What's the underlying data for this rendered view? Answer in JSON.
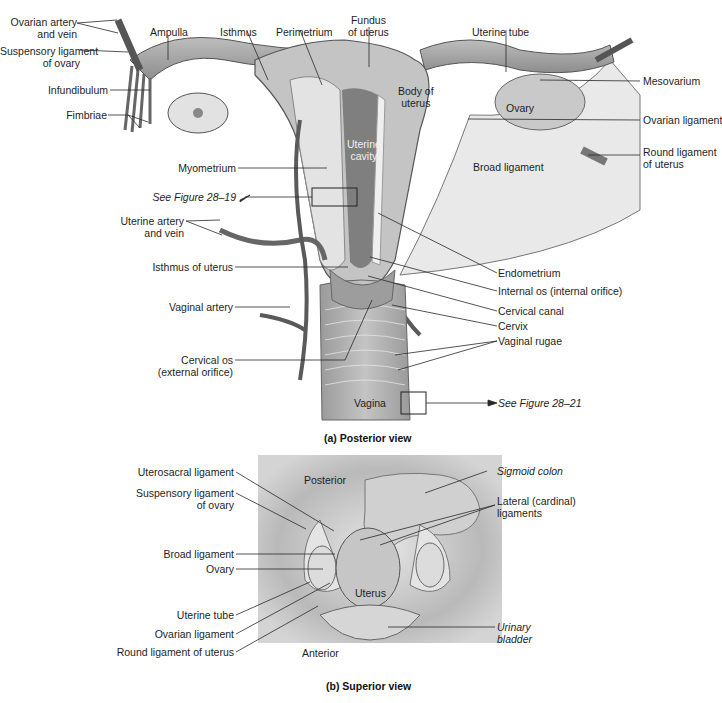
{
  "figure_a": {
    "caption": "(a) Posterior view",
    "labels": {
      "ovarian_artery_vein": [
        "Ovarian artery",
        "and vein"
      ],
      "suspensory_ligament": [
        "Suspensory ligament",
        "of ovary"
      ],
      "infundibulum": "Infundibulum",
      "fimbriae": "Fimbriae",
      "ampulla": "Ampulla",
      "isthmus": "Isthmus",
      "perimetrium": "Perimetrium",
      "fundus": [
        "Fundus",
        "of uterus"
      ],
      "uterine_tube": "Uterine tube",
      "mesovarium": "Mesovarium",
      "ovary": "Ovary",
      "ovarian_ligament": "Ovarian ligament",
      "body_of_uterus": [
        "Body of",
        "uterus"
      ],
      "uterine_cavity": [
        "Uterine",
        "cavity"
      ],
      "broad_ligament": "Broad ligament",
      "round_ligament": [
        "Round ligament",
        "of uterus"
      ],
      "myometrium": "Myometrium",
      "see_fig_19": "See Figure 28–19",
      "uterine_artery_vein": [
        "Uterine artery",
        "and vein"
      ],
      "isthmus_of_uterus": "Isthmus of uterus",
      "endometrium": "Endometrium",
      "internal_os": "Internal os (internal orifice)",
      "cervical_canal": "Cervical canal",
      "cervix": "Cervix",
      "vaginal_rugae": "Vaginal rugae",
      "vaginal_artery": "Vaginal artery",
      "cervical_os": [
        "Cervical os",
        "(external orifice)"
      ],
      "vagina": "Vagina",
      "see_fig_21": "See Figure 28–21"
    }
  },
  "figure_b": {
    "caption": "(b) Superior view",
    "labels": {
      "uterosacral_ligament": "Uterosacral ligament",
      "suspensory_ligament": [
        "Suspensory ligament",
        "of ovary"
      ],
      "broad_ligament": "Broad ligament",
      "ovary": "Ovary",
      "uterine_tube": "Uterine tube",
      "ovarian_ligament": "Ovarian ligament",
      "round_ligament": "Round ligament of uterus",
      "posterior": "Posterior",
      "anterior": "Anterior",
      "uterus": "Uterus",
      "sigmoid_colon": "Sigmoid colon",
      "lateral_ligaments": [
        "Lateral (cardinal)",
        "ligaments"
      ],
      "urinary_bladder": [
        "Urinary",
        "bladder"
      ]
    }
  },
  "colors": {
    "line": "#2a2a2a",
    "tissue_light": "#d9d9d9",
    "tissue_mid": "#a8a8a8",
    "tissue_dark": "#6a6a6a",
    "panel_bg": "#cfcfcf"
  }
}
